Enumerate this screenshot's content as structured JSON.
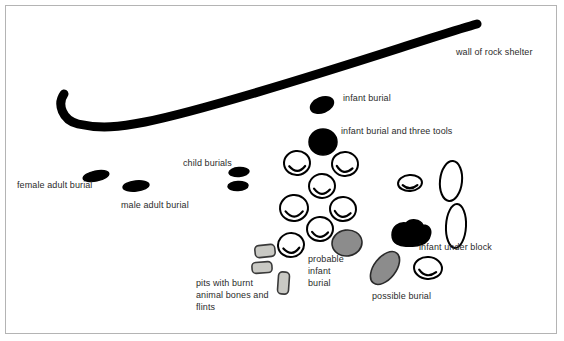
{
  "figure": {
    "type": "archaeological-site-plan",
    "background_color": "#ffffff",
    "border_color": "#b4b4b4",
    "ink_color": "#000000",
    "text_color": "#2b2b2b",
    "fill_gray": "#8c8c8c",
    "fill_pit": "#c9c9c4"
  },
  "labels": [
    {
      "id": "wall-of-rock-shelter",
      "text": "wall of rock shelter",
      "x": 456,
      "y": 46
    },
    {
      "id": "infant-burial",
      "text": "infant burial",
      "x": 343,
      "y": 92
    },
    {
      "id": "infant-burial-three-tools",
      "text": "infant burial and three tools",
      "x": 341,
      "y": 125
    },
    {
      "id": "child-burials",
      "text": "child burials",
      "x": 183,
      "y": 157
    },
    {
      "id": "female-adult-burial",
      "text": "female adult burial",
      "x": 17,
      "y": 179
    },
    {
      "id": "male-adult-burial",
      "text": "male adult burial",
      "x": 121,
      "y": 199
    },
    {
      "id": "infant-under-block",
      "text": "infant under block",
      "x": 419,
      "y": 241
    },
    {
      "id": "possible-burial",
      "text": "possible burial",
      "x": 372,
      "y": 290
    }
  ],
  "multiline_labels": [
    {
      "id": "probable-infant-burial",
      "lines": [
        "probable",
        "infant",
        "burial"
      ],
      "x": 308,
      "y": 253
    },
    {
      "id": "pits-with-burnt-bones",
      "lines": [
        "pits with burnt",
        "animal bones and",
        "flints"
      ],
      "x": 196,
      "y": 277
    }
  ],
  "features": {
    "wall": {
      "name": "wall of rock shelter",
      "stroke_width": 9,
      "path": "M 64 94 C 57 104, 62 120, 78 124 C 100 129, 120 127, 145 122 C 200 111, 300 80, 400 48 C 435 37, 462 28, 477 24"
    },
    "dark_burials": [
      {
        "id": "female-adult-burial",
        "cx": 96,
        "cy": 176,
        "rx": 13,
        "ry": 5,
        "rot": -12
      },
      {
        "id": "male-adult-burial",
        "cx": 136,
        "cy": 186,
        "rx": 13,
        "ry": 5,
        "rot": -6
      },
      {
        "id": "child-burial-upper",
        "cx": 239,
        "cy": 172,
        "rx": 10,
        "ry": 4.5,
        "rot": -4
      },
      {
        "id": "child-burial-lower",
        "cx": 238,
        "cy": 186,
        "rx": 10,
        "ry": 4.5,
        "rot": -3
      },
      {
        "id": "infant-burial",
        "cx": 322,
        "cy": 105,
        "rx": 12,
        "ry": 7.5,
        "rot": -22
      }
    ],
    "infant_burial_and_tools": {
      "id": "infant-burial-and-three-tools",
      "cx": 323,
      "cy": 142,
      "rx": 14,
      "ry": 13
    },
    "stone_cluster": {
      "name": "stone-cluster",
      "count": 9,
      "stones": [
        {
          "cx": 297,
          "cy": 163,
          "rx": 13,
          "ry": 12,
          "rot": -6
        },
        {
          "cx": 345,
          "cy": 164,
          "rx": 13,
          "ry": 12,
          "rot": 4
        },
        {
          "cx": 322,
          "cy": 186,
          "rx": 13,
          "ry": 12,
          "rot": -2
        },
        {
          "cx": 294,
          "cy": 208,
          "rx": 14,
          "ry": 13,
          "rot": -5
        },
        {
          "cx": 343,
          "cy": 209,
          "rx": 13,
          "ry": 12,
          "rot": 3
        },
        {
          "cx": 320,
          "cy": 229,
          "rx": 13,
          "ry": 12,
          "rot": -3
        },
        {
          "cx": 291,
          "cy": 245,
          "rx": 13,
          "ry": 12,
          "rot": -8
        },
        {
          "cx": 410,
          "cy": 183,
          "rx": 12,
          "ry": 8,
          "rot": -4
        },
        {
          "cx": 428,
          "cy": 268,
          "rx": 14,
          "ry": 11,
          "rot": 4
        }
      ]
    },
    "tall_stones": [
      {
        "id": "tall-stone-upper",
        "cx": 451,
        "cy": 181,
        "rx": 11,
        "ry": 20,
        "rot": 6
      },
      {
        "id": "tall-stone-lower",
        "cx": 456,
        "cy": 226,
        "rx": 10,
        "ry": 22,
        "rot": 3
      }
    ],
    "gray_burials": [
      {
        "id": "probable-infant-burial",
        "cx": 347,
        "cy": 243,
        "rx": 15,
        "ry": 13,
        "rot": -8
      },
      {
        "id": "possible-burial",
        "cx": 385,
        "cy": 268,
        "rx": 11,
        "ry": 19,
        "rot": 38
      }
    ],
    "black_block": {
      "id": "infant-under-block",
      "cx": 411,
      "cy": 235,
      "rx": 19,
      "ry": 12
    },
    "pits": [
      {
        "id": "pit-1",
        "x": 255,
        "y": 245,
        "w": 20,
        "h": 12,
        "rot": -6
      },
      {
        "id": "pit-2",
        "x": 252,
        "y": 262,
        "w": 20,
        "h": 11,
        "rot": -4
      },
      {
        "id": "pit-3",
        "x": 278,
        "y": 272,
        "w": 11,
        "h": 22,
        "rot": 4
      }
    ]
  }
}
